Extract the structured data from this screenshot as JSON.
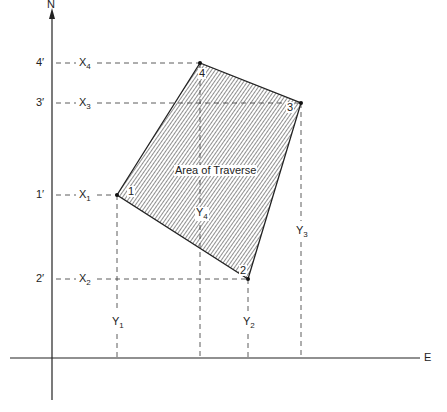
{
  "title": "Area of Traverse",
  "axes": {
    "north_label": "N",
    "east_label": "E"
  },
  "area_label": "Area of Traverse",
  "vertices": [
    {
      "id": "1",
      "label": "1",
      "x": 117,
      "y": 195
    },
    {
      "id": "2",
      "label": "2",
      "x": 248,
      "y": 279
    },
    {
      "id": "3",
      "label": "3",
      "x": 301,
      "y": 103
    },
    {
      "id": "4",
      "label": "4",
      "x": 200,
      "y": 63
    }
  ],
  "ticks": [
    {
      "label": "4′",
      "x_label": "X",
      "x_sub": "4",
      "y": 63
    },
    {
      "label": "3′",
      "x_label": "X",
      "x_sub": "3",
      "y": 103
    },
    {
      "label": "1′",
      "x_label": "X",
      "x_sub": "1",
      "y": 195
    },
    {
      "label": "2′",
      "x_label": "X",
      "x_sub": "2",
      "y": 279
    }
  ],
  "y_labels": [
    {
      "label": "Y",
      "sub": "1"
    },
    {
      "label": "Y",
      "sub": "2"
    },
    {
      "label": "Y",
      "sub": "3"
    },
    {
      "label": "Y",
      "sub": "4"
    }
  ],
  "colors": {
    "line": "#222222",
    "hatch": "#333333",
    "background": "#ffffff"
  }
}
